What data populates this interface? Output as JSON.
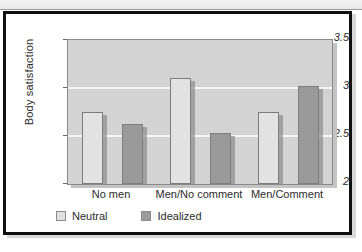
{
  "figure": {
    "frame_color": "#101010",
    "background": "#ffffff"
  },
  "chart_data": {
    "type": "bar",
    "title": "",
    "xlabel": "",
    "ylabel": "Body satisfaction",
    "ylim": [
      2,
      3.5
    ],
    "yticks": [
      "2",
      "2.5",
      "3",
      "3.5"
    ],
    "ytick_values": [
      2,
      2.5,
      3,
      3.5
    ],
    "grid": true,
    "grid_color": "#f4f4f4",
    "plot_background": "#d3d3d3",
    "legend_position": "below-axes-left",
    "categories": [
      "No men",
      "Men/No comment",
      "Men/Comment"
    ],
    "series": [
      {
        "name": "Neutral",
        "color": "#e2e2e2",
        "values": [
          2.75,
          3.1,
          2.75
        ]
      },
      {
        "name": "Idealized",
        "color": "#9a9a9a",
        "values": [
          2.63,
          2.53,
          3.02
        ]
      }
    ]
  }
}
